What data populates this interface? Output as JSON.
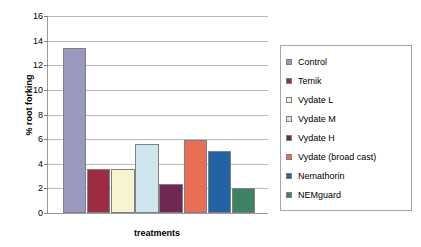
{
  "chart_data": {
    "type": "bar",
    "title": "",
    "xlabel": "treatments",
    "ylabel": "% root forking",
    "ylim": [
      0,
      16
    ],
    "ytick_step": 2,
    "yticks": [
      "0",
      "2",
      "4",
      "6",
      "8",
      "10",
      "12",
      "14",
      "16"
    ],
    "grid": true,
    "legend_position": "right",
    "categories": [
      "Control",
      "Temik",
      "Vydate L",
      "Vydate M",
      "Vydate H",
      "Vydate (broad cast)",
      "Nemathorin",
      "NEMguard"
    ],
    "values": [
      13.4,
      3.6,
      3.6,
      5.6,
      2.35,
      5.9,
      5.05,
      2.05
    ],
    "colors": [
      "#9a9ac1",
      "#9c2c44",
      "#f7f5cf",
      "#cee7ee",
      "#6e2852",
      "#ea6d56",
      "#2163a4",
      "#3d8262"
    ]
  },
  "legend": {
    "items": [
      {
        "label": "Control"
      },
      {
        "label": "Temik"
      },
      {
        "label": "Vydate L"
      },
      {
        "label": "Vydate M"
      },
      {
        "label": "Vydate H"
      },
      {
        "label": "Vydate (broad cast)"
      },
      {
        "label": "Nemathorin"
      },
      {
        "label": "NEMguard"
      }
    ]
  }
}
